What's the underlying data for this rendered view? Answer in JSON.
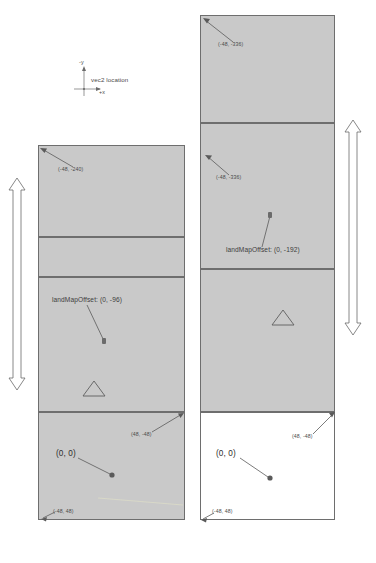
{
  "legend": {
    "axis_y_label": "-y",
    "axis_x_label": "+x",
    "caption": "vec2 location",
    "marker_name": "vec2-location-dot"
  },
  "dimension_labels": {
    "left": "LAND_CHUNK_SIZE * (LAND_CHUNKS - 1.5) = 96 * 1.5",
    "right": "LAND_CHUNK_SIZE * (LAND_CHUNKS - 1.5) = 96 * 1.5"
  },
  "diagrams": [
    {
      "id": "left-diagram",
      "name": "land-map-diagram-left",
      "cell_count": 4,
      "corner_top_left": "(-48, -240)",
      "offset_label": "landMapOffset: (0, -96)",
      "origin_label": "(0, 0)",
      "corner_top_right": "(48, -48)",
      "corner_bottom_left": "(-48, 48)",
      "triangle_marker": "triangle-marker"
    },
    {
      "id": "right-diagram",
      "name": "land-map-diagram-right",
      "cell_count": 4,
      "corner_top_left": "(-48, -336)",
      "offset_label": "landMapOffset: (0, -192)",
      "origin_label": "(0, 0)",
      "corner_top_right": "(48, -48)",
      "corner_bottom_left": "(-48, 48)",
      "triangle_marker": "triangle-marker"
    }
  ],
  "colors": {
    "cell_fill": "#c9c9c9",
    "cell_stroke": "#6e6e6e",
    "empty_fill": "#ffffff",
    "text": "#4a4a4a",
    "marker": "#6b6b6b",
    "hairline": "#d8d8c8"
  }
}
